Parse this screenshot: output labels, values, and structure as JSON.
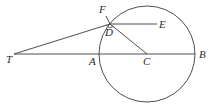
{
  "diagram": {
    "type": "geometry",
    "circle": {
      "center": "C",
      "cx": 147,
      "cy": 54,
      "r": 48
    },
    "points": {
      "T": {
        "label": "T",
        "x": 14,
        "y": 54,
        "lx": 6,
        "ly": 63
      },
      "A": {
        "label": "A",
        "x": 99,
        "y": 54,
        "lx": 89,
        "ly": 65
      },
      "C": {
        "label": "C",
        "x": 147,
        "y": 54,
        "lx": 143,
        "ly": 65
      },
      "B": {
        "label": "B",
        "x": 195,
        "y": 54,
        "lx": 199,
        "ly": 58
      },
      "D": {
        "label": "D",
        "x": 110,
        "y": 24,
        "lx": 105,
        "ly": 36
      },
      "E": {
        "label": "E",
        "x": 157,
        "y": 24,
        "lx": 159,
        "ly": 28
      },
      "F": {
        "label": "F",
        "x": 106,
        "y": 16,
        "lx": 99,
        "ly": 13
      }
    },
    "segments": [
      {
        "from": "T",
        "to": "B",
        "name": "line-TB"
      },
      {
        "from": "T",
        "to": "D",
        "name": "tangent-TD"
      },
      {
        "from": "D",
        "to": "E",
        "name": "line-DE"
      },
      {
        "from": "D",
        "to": "C",
        "name": "radius-DC"
      },
      {
        "from": "D",
        "to": "F",
        "name": "segment-DF"
      }
    ],
    "marks": [
      {
        "type": "right-angle",
        "at": "D",
        "name": "right-angle-mark-D"
      }
    ]
  }
}
